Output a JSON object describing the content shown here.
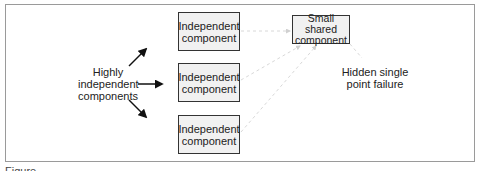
{
  "diagram": {
    "left_label": [
      "Highly",
      "independent",
      "components"
    ],
    "independent_boxes": [
      {
        "line1": "Independent",
        "line2": "component"
      },
      {
        "line1": "Independent",
        "line2": "component"
      },
      {
        "line1": "Independent",
        "line2": "component"
      }
    ],
    "shared_box": {
      "line1": "Small shared",
      "line2": "component"
    },
    "right_label": [
      "Hidden single",
      "point failure"
    ],
    "colors": {
      "box_fill": "#f1f1f1",
      "box_border": "#333333",
      "frame_border": "#9a9a9a",
      "dashed_connector": "#d8d8d8",
      "arrow": "#111111"
    }
  },
  "caption": "Figure . . . . . . . . . ."
}
